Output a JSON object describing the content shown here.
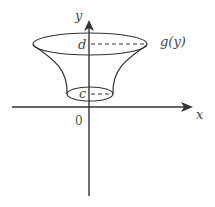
{
  "figure": {
    "labels": {
      "y_axis": "y",
      "x_axis": "x",
      "origin": "0",
      "upper_bound": "d",
      "lower_bound": "c",
      "curve": "g(y)"
    }
  }
}
